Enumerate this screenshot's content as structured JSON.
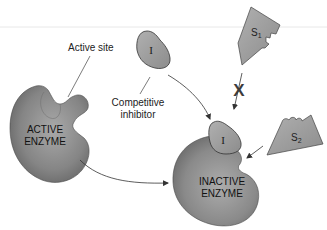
{
  "labels": {
    "active_site": "Active site",
    "competitive_inhibitor_line1": "Competitive",
    "competitive_inhibitor_line2": "inhibitor",
    "active_enzyme_line1": "ACTIVE",
    "active_enzyme_line2": "ENZYME",
    "inactive_enzyme_line1": "INACTIVE",
    "inactive_enzyme_line2": "ENZYME",
    "inhibitor_symbol": "I",
    "inhibitor_bound_symbol": "I",
    "substrate1": "S",
    "substrate1_sub": "1",
    "substrate2": "S",
    "substrate2_sub": "2",
    "blocked_mark": "X"
  },
  "colors": {
    "enzyme_dark": "#5f5f5f",
    "enzyme_light": "#a8a8a8",
    "shape_fill": "#9c9c9c",
    "outline": "#3a3a3a",
    "blocked_mark": "#3c3c3c",
    "rule_line": "#e6e6e6"
  }
}
